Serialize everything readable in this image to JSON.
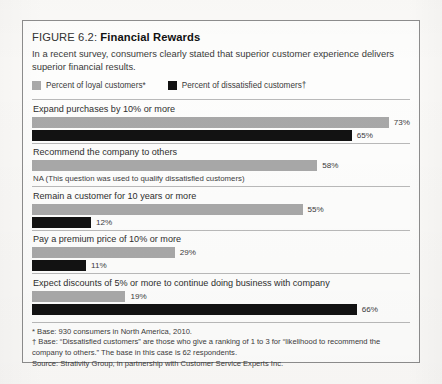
{
  "figure": {
    "label": "FIGURE 6.2:",
    "name": "Financial Rewards",
    "description": "In a recent survey, consumers clearly stated that superior customer experience delivers superior financial results."
  },
  "legend": [
    {
      "key": "loyal",
      "label": "Percent of loyal customers*",
      "color": "#a9a9a9"
    },
    {
      "key": "dissatisfied",
      "label": "Percent of dissatisfied customers†",
      "color": "#121212"
    }
  ],
  "notes": {
    "na": "NA (This question was used to qualify dissatisfied customers)"
  },
  "footnotes": [
    "* Base: 930 consumers in North America, 2010.",
    "† Base: “Dissatisfied customers” are those who give a ranking of 1 to 3 for “likelihood to recommend the",
    "company to others.” The base in this case is 62 respondents.",
    "Source: Strativity Group, in partnership with Customer Service Experts Inc."
  ],
  "chart_data": {
    "type": "bar",
    "orientation": "horizontal",
    "title": "Financial Rewards",
    "xlabel": "",
    "ylabel": "",
    "xlim": [
      0,
      75
    ],
    "grid": false,
    "legend_position": "top-left",
    "categories": [
      "Expand purchases by 10% or more",
      "Recommend the company to others",
      "Remain a customer for 10 years or more",
      "Pay a premium price of 10% or more",
      "Expect discounts of 5% or more to continue doing business with company"
    ],
    "series": [
      {
        "name": "Percent of loyal customers*",
        "color": "#a8a8a8",
        "values": [
          73,
          58,
          55,
          29,
          19
        ],
        "labels": [
          "73%",
          "58%",
          "55%",
          "29%",
          "19%"
        ]
      },
      {
        "name": "Percent of dissatisfied customers†",
        "color": "#121212",
        "values": [
          65,
          null,
          12,
          11,
          66
        ],
        "labels": [
          "65%",
          "NA",
          "12%",
          "11%",
          "66%"
        ]
      }
    ]
  }
}
